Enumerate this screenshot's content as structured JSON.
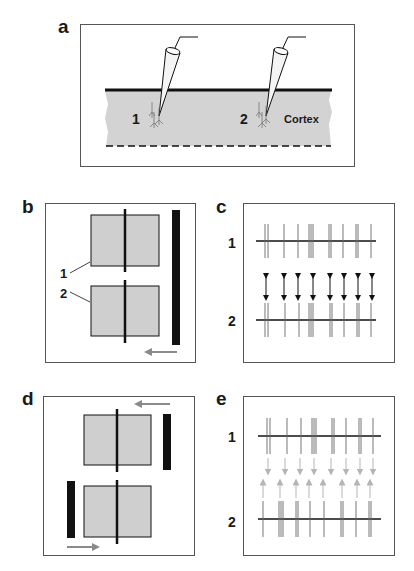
{
  "panels": {
    "a": {
      "letter": "a",
      "electrode_labels": [
        "1",
        "2"
      ],
      "tissue_label": "Cortex"
    },
    "b": {
      "letter": "b",
      "field_labels": [
        "1",
        "2"
      ]
    },
    "c": {
      "letter": "c",
      "train_labels": [
        "1",
        "2"
      ]
    },
    "d": {
      "letter": "d"
    },
    "e": {
      "letter": "e",
      "train_labels": [
        "1",
        "2"
      ]
    }
  },
  "colors": {
    "tissue_fill": "#d3d3d3",
    "field_fill": "#cfcfcf",
    "bar": "#111111",
    "arrow_gray": "#8a8a8a",
    "arrow_light": "#b5b5b5",
    "spike": "#666666"
  }
}
